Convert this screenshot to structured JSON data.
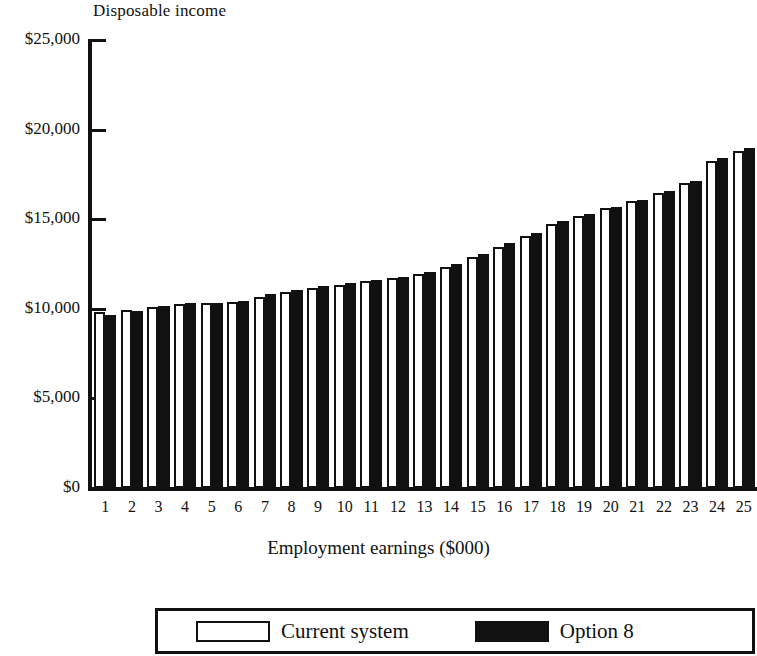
{
  "chart_data": {
    "type": "bar",
    "title": "",
    "ylabel": "Disposable income",
    "xlabel": "Employment earnings ($000)",
    "categories": [
      "1",
      "2",
      "3",
      "4",
      "5",
      "6",
      "7",
      "8",
      "9",
      "10",
      "11",
      "12",
      "13",
      "14",
      "15",
      "16",
      "17",
      "18",
      "19",
      "20",
      "21",
      "22",
      "23",
      "24",
      "25"
    ],
    "ylim": [
      0,
      25000
    ],
    "ytick_labels": [
      "$0",
      "$5,000",
      "$10,000",
      "$15,000",
      "$20,000",
      "$25,000"
    ],
    "ytick_values": [
      0,
      5000,
      10000,
      15000,
      20000,
      25000
    ],
    "grid": false,
    "legend_position": "bottom",
    "series": [
      {
        "name": "Current system",
        "fill": "#ffffff",
        "values": [
          9800,
          9950,
          10100,
          10250,
          10300,
          10400,
          10650,
          10950,
          11150,
          11350,
          11550,
          11700,
          11950,
          12350,
          12900,
          13450,
          14050,
          14750,
          15200,
          15600,
          16000,
          16450,
          17000,
          18250,
          18800
        ]
      },
      {
        "name": "Option 8",
        "fill": "#111111",
        "values": [
          9650,
          9900,
          10150,
          10300,
          10300,
          10450,
          10800,
          11050,
          11250,
          11450,
          11600,
          11800,
          12050,
          12500,
          13050,
          13700,
          14250,
          14900,
          15300,
          15700,
          16100,
          16550,
          17150,
          18400,
          19000
        ]
      }
    ]
  },
  "axis": {
    "y_title": "Disposable income",
    "x_title": "Employment earnings ($000)"
  },
  "legend": {
    "items": [
      {
        "label": "Current system",
        "swatch": "white"
      },
      {
        "label": "Option 8",
        "swatch": "black"
      }
    ]
  }
}
